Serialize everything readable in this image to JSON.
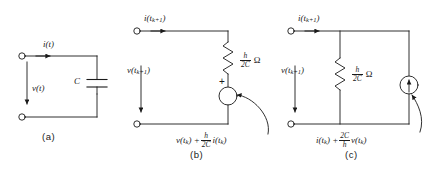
{
  "figure": {
    "background": "#ffffff",
    "ink": "#1a1a1a",
    "caption_a": "(a)",
    "caption_b": "(b)",
    "caption_c": "(c)"
  },
  "circuit_a": {
    "name": "capacitor",
    "current_label": "i(t)",
    "voltage_label": "v(t)",
    "element_label": "C",
    "element_type": "capacitor"
  },
  "circuit_b": {
    "name": "thevenin-companion-model",
    "current_label_i": "i(t",
    "current_label_sub": "k+1",
    "current_label_end": ")",
    "voltage_label_v": "v(t",
    "voltage_label_sub": "k+1",
    "voltage_label_end": ")",
    "resistor_num": "h",
    "resistor_den": "2C",
    "resistor_unit": "Ω",
    "source_polarity": "+",
    "source_v": "v(t",
    "source_v_sub": "k",
    "source_plus": ") +",
    "source_num": "h",
    "source_den": "2C",
    "source_i": "i(t",
    "source_i_sub": "k",
    "source_i_end": ")"
  },
  "circuit_c": {
    "name": "norton-companion-model",
    "current_label_i": "i(t",
    "current_label_sub": "k+1",
    "current_label_end": ")",
    "voltage_label_v": "v(t",
    "voltage_label_sub": "k+1",
    "voltage_label_end": ")",
    "resistor_num": "h",
    "resistor_den": "2C",
    "resistor_unit": "Ω",
    "source_i": "i(t",
    "source_i_sub": "k",
    "source_plus": ") +",
    "source_num": "2C",
    "source_den": "h",
    "source_v": "v(t",
    "source_v_sub": "k",
    "source_v_end": ")"
  }
}
